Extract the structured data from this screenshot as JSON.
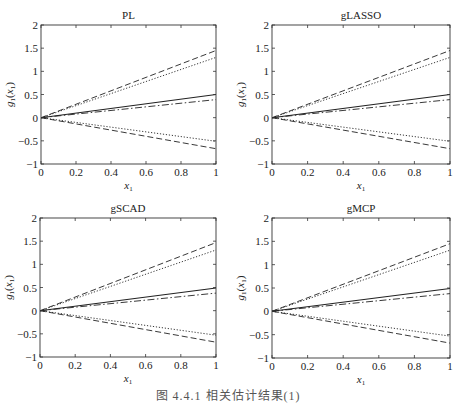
{
  "figure": {
    "caption": "图 4.4.1  相关估计结果(1)"
  },
  "chart_data": [
    {
      "type": "line",
      "title": "PL",
      "xlabel": "x1",
      "ylabel": "g1(x1)",
      "xlim": [
        0,
        1
      ],
      "ylim": [
        -1,
        2
      ],
      "xticks": [
        "0",
        "0.2",
        "0.4",
        "0.6",
        "0.8",
        "1"
      ],
      "yticks": [
        "−1",
        "−0.5",
        "0",
        "0.5",
        "1",
        "1.5",
        "2"
      ],
      "grid": false,
      "legend": "none",
      "x": [
        0,
        1
      ],
      "series": [
        {
          "name": "upper-dashed",
          "style": "dashed",
          "values": [
            0,
            1.45
          ]
        },
        {
          "name": "upper-dotted",
          "style": "dotted",
          "values": [
            0,
            1.3
          ]
        },
        {
          "name": "solid",
          "style": "solid",
          "values": [
            0,
            0.5
          ]
        },
        {
          "name": "dash-dot",
          "style": "dashdot",
          "values": [
            0,
            0.39
          ]
        },
        {
          "name": "lower-dotted",
          "style": "dotted",
          "values": [
            0,
            -0.51
          ]
        },
        {
          "name": "lower-dashed",
          "style": "dashed",
          "values": [
            0,
            -0.67
          ]
        }
      ]
    },
    {
      "type": "line",
      "title": "gLASSO",
      "xlabel": "x1",
      "ylabel": "g1(x1)",
      "xlim": [
        0,
        1
      ],
      "ylim": [
        -1,
        2
      ],
      "xticks": [
        "0",
        "0.2",
        "0.4",
        "0.6",
        "0.8",
        "1"
      ],
      "yticks": [
        "−1",
        "−0.5",
        "0",
        "0.5",
        "1",
        "1.5",
        "2"
      ],
      "grid": false,
      "legend": "none",
      "x": [
        0,
        1
      ],
      "series": [
        {
          "name": "upper-dashed",
          "style": "dashed",
          "values": [
            0,
            1.45
          ]
        },
        {
          "name": "upper-dotted",
          "style": "dotted",
          "values": [
            0,
            1.3
          ]
        },
        {
          "name": "solid",
          "style": "solid",
          "values": [
            0,
            0.5
          ]
        },
        {
          "name": "dash-dot",
          "style": "dashdot",
          "values": [
            0,
            0.39
          ]
        },
        {
          "name": "lower-dotted",
          "style": "dotted",
          "values": [
            0,
            -0.51
          ]
        },
        {
          "name": "lower-dashed",
          "style": "dashed",
          "values": [
            0,
            -0.67
          ]
        }
      ]
    },
    {
      "type": "line",
      "title": "gSCAD",
      "xlabel": "x1",
      "ylabel": "g1(x1)",
      "xlim": [
        0,
        1
      ],
      "ylim": [
        -1,
        2
      ],
      "xticks": [
        "0",
        "0.2",
        "0.4",
        "0.6",
        "0.8",
        "1"
      ],
      "yticks": [
        "−1",
        "−0.5",
        "0",
        "0.5",
        "1",
        "1.5",
        "2"
      ],
      "grid": false,
      "legend": "none",
      "x": [
        0,
        1
      ],
      "series": [
        {
          "name": "upper-dashed",
          "style": "dashed",
          "values": [
            0,
            1.47
          ]
        },
        {
          "name": "upper-dotted",
          "style": "dotted",
          "values": [
            0,
            1.31
          ]
        },
        {
          "name": "solid",
          "style": "solid",
          "values": [
            0,
            0.49
          ]
        },
        {
          "name": "dash-dot",
          "style": "dashdot",
          "values": [
            0,
            0.38
          ]
        },
        {
          "name": "lower-dotted",
          "style": "dotted",
          "values": [
            0,
            -0.53
          ]
        },
        {
          "name": "lower-dashed",
          "style": "dashed",
          "values": [
            0,
            -0.68
          ]
        }
      ]
    },
    {
      "type": "line",
      "title": "gMCP",
      "xlabel": "x1",
      "ylabel": "g1(x1)",
      "xlim": [
        0,
        1
      ],
      "ylim": [
        -1,
        2
      ],
      "xticks": [
        "0",
        "0.2",
        "0.4",
        "0.6",
        "0.8",
        "1"
      ],
      "yticks": [
        "−1",
        "−0.5",
        "0",
        "0.5",
        "1",
        "1.5",
        "2"
      ],
      "grid": false,
      "legend": "none",
      "x": [
        0,
        1
      ],
      "series": [
        {
          "name": "upper-dashed",
          "style": "dashed",
          "values": [
            0,
            1.45
          ]
        },
        {
          "name": "upper-dotted",
          "style": "dotted",
          "values": [
            0,
            1.31
          ]
        },
        {
          "name": "solid",
          "style": "solid",
          "values": [
            0,
            0.49
          ]
        },
        {
          "name": "dash-dot",
          "style": "dashdot",
          "values": [
            0,
            0.38
          ]
        },
        {
          "name": "lower-dotted",
          "style": "dotted",
          "values": [
            0,
            -0.53
          ]
        },
        {
          "name": "lower-dashed",
          "style": "dashed",
          "values": [
            0,
            -0.68
          ]
        }
      ]
    }
  ],
  "style": {
    "line_color": "#222222",
    "axis_color": "#333333"
  }
}
